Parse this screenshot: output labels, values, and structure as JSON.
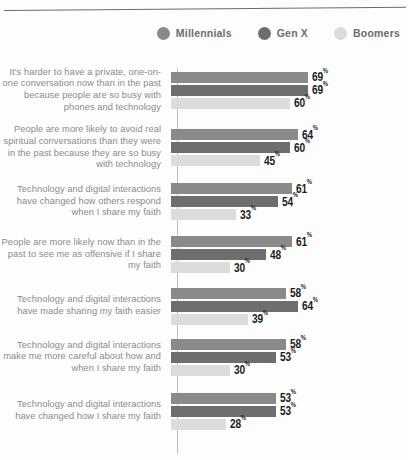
{
  "legend": {
    "items": [
      {
        "label": "Millennials",
        "color": "#8a8a8a",
        "icon": "circle-icon"
      },
      {
        "label": "Gen X",
        "color": "#6e6e6e",
        "icon": "circle-icon"
      },
      {
        "label": "Boomers",
        "color": "#dcdcdc",
        "icon": "circle-icon"
      }
    ]
  },
  "chart_data": {
    "type": "bar",
    "orientation": "horizontal",
    "title": "",
    "xlabel": "",
    "ylabel": "",
    "xlim": [
      0,
      100
    ],
    "grid": false,
    "legend_position": "top-right",
    "value_suffix": "%",
    "categories": [
      "It's harder to have a private, one-on-one conversation now than in the past because people are so busy with phones and technology",
      "People are more likely to avoid real spiritual conversations than they were in the past because they are so busy with technology",
      "Technology and digital interactions have changed how others respond when I share my faith",
      "People are more likely now than in the past to see me as offensive if I share my faith",
      "Technology and digital interactions have made sharing my faith easier",
      "Technology and digital interactions make me more careful about how and when I share my faith",
      "Technology and digital interactions have changed how I share my faith"
    ],
    "series": [
      {
        "name": "Millennials",
        "color": "#8a8a8a",
        "values": [
          69,
          64,
          61,
          61,
          58,
          58,
          53
        ]
      },
      {
        "name": "Gen X",
        "color": "#6e6e6e",
        "values": [
          69,
          60,
          54,
          48,
          64,
          53,
          53
        ]
      },
      {
        "name": "Boomers",
        "color": "#dcdcdc",
        "values": [
          60,
          45,
          33,
          30,
          39,
          30,
          28
        ]
      }
    ],
    "value_labels": [
      [
        "69",
        "69",
        "60"
      ],
      [
        "64",
        "60",
        "45"
      ],
      [
        "61",
        "54",
        "33"
      ],
      [
        "61",
        "48",
        "30"
      ],
      [
        "58",
        "64",
        "39"
      ],
      [
        "58",
        "53",
        "30"
      ],
      [
        "53",
        "53",
        "28"
      ]
    ],
    "group_heights": [
      60,
      55,
      53,
      53,
      50,
      52,
      56
    ]
  }
}
